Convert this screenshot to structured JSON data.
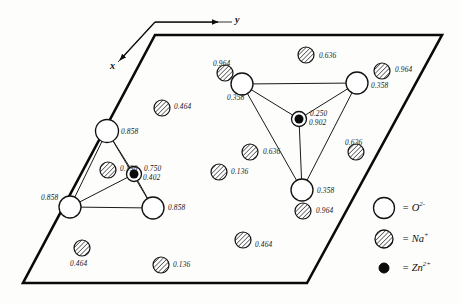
{
  "figure": {
    "type": "crystal-structure-projection",
    "cell": {
      "shape": "parallelogram",
      "corners": [
        [
          155,
          35
        ],
        [
          442,
          35
        ],
        [
          307,
          283
        ],
        [
          23,
          283
        ]
      ]
    },
    "axes": {
      "origin": [
        155,
        22
      ],
      "y_label": "y",
      "x_label": "x"
    }
  },
  "legend": {
    "items": [
      {
        "symbol": "open-circle",
        "species": "O",
        "charge": "2-",
        "text": "= O",
        "sup": "2-"
      },
      {
        "symbol": "hatched-circle",
        "species": "Na",
        "charge": "+",
        "text": "= Na",
        "sup": "+"
      },
      {
        "symbol": "filled-circle",
        "species": "Zn",
        "charge": "2+",
        "text": "= Zn",
        "sup": "2+"
      }
    ]
  },
  "colors": {
    "ink": "#111111",
    "cell_outline": "#0a0a0a",
    "bond": "#1a1a1a",
    "hatch": "#2a2a2a",
    "paper": "#fdfdfc"
  },
  "atoms": {
    "oxygen": [
      {
        "id": "O-L-top",
        "cx": 107,
        "cy": 131,
        "r": 11.5,
        "height": "0.858",
        "lx": 121,
        "ly": 128,
        "group": "left-tetrahedron"
      },
      {
        "id": "O-L-left",
        "cx": 70,
        "cy": 207,
        "r": 11.0,
        "height": "0.858",
        "lx": 41,
        "ly": 194,
        "group": "left-tetrahedron"
      },
      {
        "id": "O-L-right",
        "cx": 153,
        "cy": 208,
        "r": 11.0,
        "height": "0.858",
        "lx": 168,
        "ly": 204,
        "group": "left-tetrahedron"
      },
      {
        "id": "O-R-left",
        "cx": 242,
        "cy": 84,
        "r": 11.0,
        "height": "0.358",
        "lx": 227,
        "ly": 94,
        "group": "right-tetrahedron"
      },
      {
        "id": "O-R-right",
        "cx": 357,
        "cy": 83,
        "r": 11.0,
        "height": "0.358",
        "lx": 371,
        "ly": 82,
        "group": "right-tetrahedron"
      },
      {
        "id": "O-R-bottom",
        "cx": 302,
        "cy": 190,
        "r": 11.0,
        "height": "0.358",
        "lx": 317,
        "ly": 187,
        "group": "right-tetrahedron"
      }
    ],
    "zinc": [
      {
        "id": "Zn-left",
        "cx": 134,
        "cy": 174,
        "r": 7.5,
        "height1": "0.750",
        "height2": "0.402",
        "lx": 144,
        "ly": 165,
        "group": "left-tetrahedron"
      },
      {
        "id": "Zn-right",
        "cx": 299,
        "cy": 119,
        "r": 7.5,
        "height1": "0.250",
        "height2": "0.902",
        "lx": 310,
        "ly": 110,
        "group": "right-tetrahedron"
      }
    ],
    "sodium": [
      {
        "id": "Na-1",
        "cx": 162,
        "cy": 108,
        "r": 8.0,
        "height": "0.464",
        "lx": 174,
        "ly": 103
      },
      {
        "id": "Na-2",
        "cx": 108,
        "cy": 170,
        "r": 8.0,
        "height": "0.136",
        "lx": 120,
        "ly": 165
      },
      {
        "id": "Na-3",
        "cx": 82,
        "cy": 248,
        "r": 8.0,
        "height": "0.464",
        "lx": 70,
        "ly": 260
      },
      {
        "id": "Na-4",
        "cx": 161,
        "cy": 265,
        "r": 8.0,
        "height": "0.136",
        "lx": 173,
        "ly": 261
      },
      {
        "id": "Na-5",
        "cx": 243,
        "cy": 240,
        "r": 8.0,
        "height": "0.464",
        "lx": 255,
        "ly": 241
      },
      {
        "id": "Na-6",
        "cx": 219,
        "cy": 172,
        "r": 8.0,
        "height": "0.136",
        "lx": 231,
        "ly": 168
      },
      {
        "id": "Na-7",
        "cx": 250,
        "cy": 152,
        "r": 8.0,
        "height": "0.636",
        "lx": 263,
        "ly": 148
      },
      {
        "id": "Na-8",
        "cx": 225,
        "cy": 73,
        "r": 8.0,
        "height": "0.964",
        "lx": 213,
        "ly": 60
      },
      {
        "id": "Na-9",
        "cx": 306,
        "cy": 55,
        "r": 8.0,
        "height": "0.636",
        "lx": 319,
        "ly": 52
      },
      {
        "id": "Na-10",
        "cx": 382,
        "cy": 71,
        "r": 8.0,
        "height": "0.964",
        "lx": 395,
        "ly": 66
      },
      {
        "id": "Na-11",
        "cx": 356,
        "cy": 152,
        "r": 8.0,
        "height": "0.636",
        "lx": 345,
        "ly": 139
      },
      {
        "id": "Na-12",
        "cx": 303,
        "cy": 211,
        "r": 8.0,
        "height": "0.964",
        "lx": 316,
        "ly": 207
      }
    ]
  },
  "bonds": [
    {
      "from": "Zn-left",
      "to": "O-L-top"
    },
    {
      "from": "Zn-left",
      "to": "O-L-left"
    },
    {
      "from": "Zn-left",
      "to": "O-L-right"
    },
    {
      "from": "O-L-top",
      "to": "O-L-left"
    },
    {
      "from": "O-L-top",
      "to": "O-L-right"
    },
    {
      "from": "O-L-left",
      "to": "O-L-right"
    },
    {
      "from": "Zn-right",
      "to": "O-R-left"
    },
    {
      "from": "Zn-right",
      "to": "O-R-right"
    },
    {
      "from": "Zn-right",
      "to": "O-R-bottom"
    },
    {
      "from": "O-R-left",
      "to": "O-R-right"
    },
    {
      "from": "O-R-left",
      "to": "O-R-bottom"
    },
    {
      "from": "O-R-right",
      "to": "O-R-bottom"
    }
  ],
  "legend_marks": {
    "oxygen": {
      "cx": 384,
      "cy": 208,
      "r": 10.5
    },
    "sodium": {
      "cx": 384,
      "cy": 239,
      "r": 9.0
    },
    "zinc": {
      "cx": 384,
      "cy": 268,
      "r": 5.0
    }
  }
}
